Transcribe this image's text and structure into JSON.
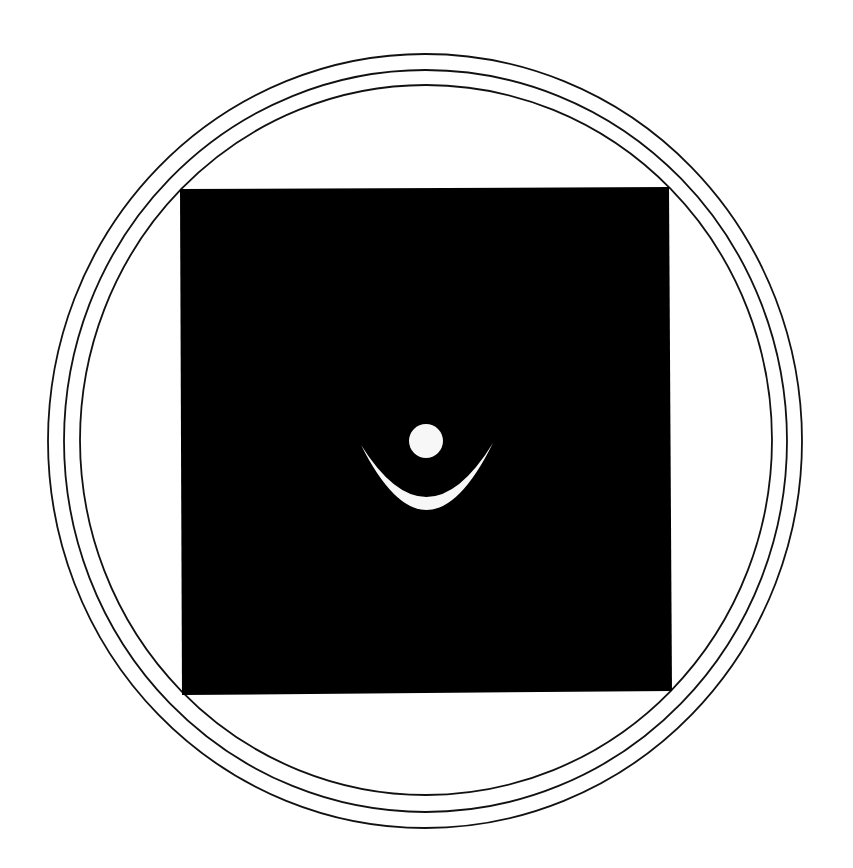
{
  "canvas": {
    "width": 853,
    "height": 868,
    "background": "#ffffff"
  },
  "rings": [
    {
      "name": "outer-ring",
      "cx": 425,
      "cy": 441,
      "rx": 377,
      "ry": 387,
      "stroke": "#111111",
      "stroke_width": 1.8
    },
    {
      "name": "middle-ring",
      "cx": 425.5,
      "cy": 441,
      "rx": 361.5,
      "ry": 371,
      "stroke": "#111111",
      "stroke_width": 1.8
    },
    {
      "name": "inner-ring",
      "cx": 426,
      "cy": 440,
      "rx": 346,
      "ry": 355,
      "stroke": "#111111",
      "stroke_width": 1.8
    }
  ],
  "square": {
    "fill": "#000000",
    "points": "180,189 669,187 672,691 182,695"
  },
  "symbol": {
    "fill": "#f7f7f7",
    "dot": {
      "cx": 426,
      "cy": 441,
      "r": 17
    },
    "crescent": {
      "left_tip": [
        361,
        445
      ],
      "right_tip": [
        493,
        443
      ],
      "outer_bottom_y": 510,
      "inner_bottom_y": 497
    }
  }
}
